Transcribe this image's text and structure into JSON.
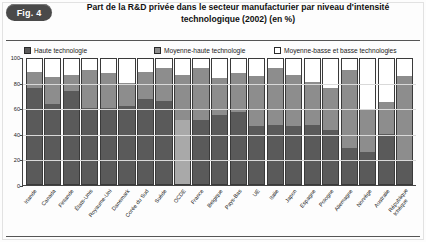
{
  "figure": {
    "badge": "Fig. 4",
    "title": "Part de la R&D privée dans le secteur manufacturier par niveau d'intensité technologique (2002) (en %)"
  },
  "legend": {
    "items": [
      {
        "label": "Haute technologie",
        "swatch": "dark-gray",
        "color": "#5a5a5a",
        "icon": "legend-swatch-icon"
      },
      {
        "label": "Moyenne-haute technologie",
        "swatch": "medium-gray",
        "color": "#8d8d8d",
        "icon": "legend-swatch-icon"
      },
      {
        "label": "Moyenne-basse et basse technologies",
        "swatch": "white-outline",
        "color": "#ffffff",
        "icon": "legend-swatch-icon"
      }
    ]
  },
  "chart_data": {
    "type": "bar",
    "stacked": true,
    "title": "Part de la R&D privée dans le secteur manufacturier par niveau d'intensité technologique (2002) (en %)",
    "xlabel": "",
    "ylabel": "",
    "ylim": [
      0,
      100
    ],
    "yticks": [
      0,
      20,
      40,
      60,
      80,
      100
    ],
    "grid": true,
    "legend_position": "top",
    "units": "%",
    "categories": [
      "Irlande",
      "Canada",
      "Finlande",
      "États-Unis",
      "Royaume-Uni",
      "Danemark",
      "Corée du Sud",
      "Suède",
      "OCDE",
      "France",
      "Belgique",
      "Pays-Bas",
      "UE",
      "Italie",
      "Japon",
      "Espagne",
      "Pologne",
      "Allemagne",
      "Norvège",
      "Australie",
      "République tchèque"
    ],
    "series": [
      {
        "name": "Haute technologie",
        "color": "#5a5a5a",
        "values": [
          77,
          64,
          74,
          61,
          61,
          62,
          68,
          66,
          51,
          51,
          55,
          58,
          46,
          47,
          46,
          47,
          43,
          29,
          26,
          40,
          19
        ]
      },
      {
        "name": "Moyenne-haute technologie",
        "color": "#8d8d8d",
        "values": [
          13,
          22,
          13,
          30,
          28,
          19,
          22,
          27,
          36,
          42,
          30,
          31,
          40,
          46,
          41,
          35,
          34,
          62,
          33,
          26,
          67
        ]
      },
      {
        "name": "Moyenne-basse et basse technologies",
        "color": "#ffffff",
        "values": [
          10,
          14,
          13,
          9,
          11,
          19,
          10,
          7,
          13,
          7,
          15,
          11,
          14,
          7,
          13,
          18,
          23,
          9,
          41,
          34,
          14
        ]
      }
    ],
    "totals": [
      100,
      100,
      100,
      100,
      100,
      100,
      100,
      100,
      100,
      100,
      100,
      100,
      100,
      100,
      100,
      100,
      100,
      100,
      100,
      100,
      100
    ]
  }
}
